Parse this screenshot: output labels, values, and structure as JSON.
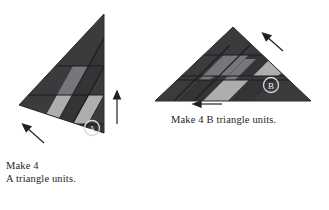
{
  "document": {
    "kind": "quilting-block-assembly-diagram",
    "background_color": "#ffffff"
  },
  "palette": {
    "fabric_dark": "#3b3b3d",
    "fabric_dark_alt": "#343436",
    "fabric_medium": "#76777a",
    "fabric_light": "#adaeb0",
    "seam_line": "#1c1c1e",
    "outline": "#2a2a2c",
    "label_ring": "#d6d7d9",
    "text": "#231f20",
    "arrow": "#231f20"
  },
  "units": [
    {
      "id": "A",
      "badge_label": "A",
      "caption_lines": [
        "Make 4",
        "A triangle units."
      ],
      "shape": "half-square triangle with apex at top right",
      "strip_shades": [
        "medium",
        "light",
        "medium",
        "light"
      ],
      "arrows": [
        {
          "name": "press-direction-up",
          "direction": "up"
        },
        {
          "name": "press-direction-up-left",
          "direction": "up-left"
        }
      ]
    },
    {
      "id": "B",
      "badge_label": "B",
      "caption_lines": [
        "Make 4 B triangle units."
      ],
      "shape": "wide isosceles triangle with apex at top center",
      "strip_shades": [
        "light",
        "medium",
        "light",
        "medium"
      ],
      "arrows": [
        {
          "name": "press-direction-up-left",
          "direction": "up-left"
        },
        {
          "name": "press-direction-left",
          "direction": "left"
        }
      ]
    }
  ],
  "captions": {
    "unit_a_line1": "Make 4",
    "unit_a_line2": "A triangle units.",
    "unit_b_line1": "Make 4 B triangle units."
  },
  "badges": {
    "a": "A",
    "b": "B"
  }
}
